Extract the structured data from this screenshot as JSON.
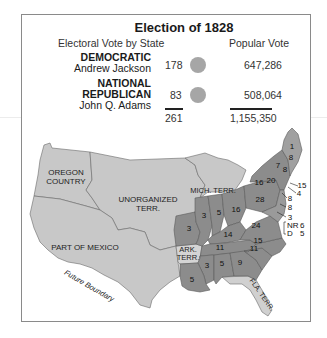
{
  "title": "Election of 1828",
  "headers": {
    "electoral": "Electoral Vote by State",
    "popular": "Popular Vote"
  },
  "candidates": [
    {
      "party": "DEMOCRATIC",
      "name": "Andrew Jackson",
      "electoral_votes": "178",
      "popular_vote": "647,286",
      "color": "#a6a6a6"
    },
    {
      "party_line1": "NATIONAL",
      "party_line2": "REPUBLICAN",
      "name": "John Q. Adams",
      "electoral_votes": "83",
      "popular_vote": "508,064",
      "color": "#a6a6a6"
    }
  ],
  "totals": {
    "electoral": "261",
    "popular": "1,155,350"
  },
  "map": {
    "colors": {
      "territory": "#c8c8c8",
      "democratic": "#8c8c8c",
      "national_republican": "#a9a9a9",
      "border": "#6a6a6a"
    },
    "region_labels": {
      "oregon_1": "OREGON",
      "oregon_2": "COUNTRY",
      "unorganized_1": "UNORGANIZED",
      "unorganized_2": "TERR.",
      "mexico": "PART OF MEXICO",
      "mich": "MICH. TERR.",
      "ark_1": "ARK.",
      "ark_2": "TERR.",
      "fla": "FLA. TERR.",
      "future_boundary": "Future Boundary"
    },
    "state_votes": {
      "maine_nr": "1",
      "maine_d": "8",
      "nh": "8",
      "vt": "7",
      "ma": "15",
      "ri": "4",
      "ct": "8",
      "nj": "8",
      "de": "3",
      "ny": "20",
      "pa": "28",
      "ohio": "16",
      "indiana": "5",
      "illinois": "3",
      "missouri": "3",
      "kentucky": "14",
      "virginia": "24",
      "tennessee": "11",
      "nc": "15",
      "sc": "11",
      "georgia": "9",
      "alabama": "5",
      "mississippi": "3",
      "louisiana": "5",
      "ny_west": "16",
      "md_nr_label": "NR",
      "md_nr": "6",
      "md_d_label": "D",
      "md_d": "5"
    }
  }
}
